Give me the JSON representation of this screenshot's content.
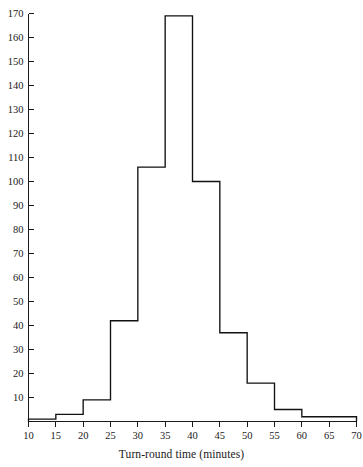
{
  "chart_data": {
    "type": "bar",
    "title": "",
    "subtitle": "",
    "xlabel": "Turn-round time (minutes)",
    "ylabel": "",
    "bin_width": 5,
    "bin_edges": [
      10,
      15,
      20,
      25,
      30,
      35,
      40,
      45,
      50,
      55,
      60,
      65,
      70
    ],
    "categories": [
      "10-15",
      "15-20",
      "20-25",
      "25-30",
      "30-35",
      "35-40",
      "40-45",
      "45-50",
      "50-55",
      "55-60",
      "60-65",
      "65-70"
    ],
    "values": [
      1,
      3,
      9,
      42,
      106,
      169,
      100,
      37,
      16,
      5,
      2,
      2
    ],
    "xlim": [
      10,
      70
    ],
    "ylim": [
      0,
      170
    ],
    "x_ticks": [
      10,
      15,
      20,
      25,
      30,
      35,
      40,
      45,
      50,
      55,
      60,
      65,
      70
    ],
    "x_tick_labels": [
      "10",
      "15",
      "20",
      "25",
      "30",
      "35",
      "40",
      "45",
      "50",
      "55",
      "60",
      "65",
      "70"
    ],
    "y_ticks": [
      10,
      20,
      30,
      40,
      50,
      60,
      70,
      80,
      90,
      100,
      110,
      120,
      130,
      140,
      150,
      160,
      170
    ],
    "y_tick_labels": [
      "10",
      "20",
      "30",
      "40",
      "50",
      "60",
      "70",
      "80",
      "90",
      "100",
      "110",
      "120",
      "130",
      "140",
      "150",
      "160",
      "170"
    ],
    "grid": false,
    "legend": "none",
    "bar_fill_color": "#ffffff",
    "bar_edge_color": "#111111",
    "axis_color": "#1a1a1a"
  }
}
